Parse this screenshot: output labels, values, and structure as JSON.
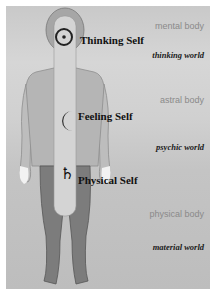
{
  "selves": [
    {
      "label": "Thinking Self",
      "symbol": "circled-dot"
    },
    {
      "label": "Feeling Self",
      "symbol": "crescent-moon"
    },
    {
      "label": "Physical Self",
      "symbol": "saturn"
    }
  ],
  "bodies": [
    "mental body",
    "astral body",
    "physical body"
  ],
  "worlds": [
    "thinking world",
    "psychic world",
    "material world"
  ],
  "symbols": {
    "saturn": "♄"
  },
  "colors": {
    "torso": "#b3b3b3",
    "spine": "#d2d2d2",
    "legs": "#7c7c7c",
    "background": "#cccccc"
  }
}
